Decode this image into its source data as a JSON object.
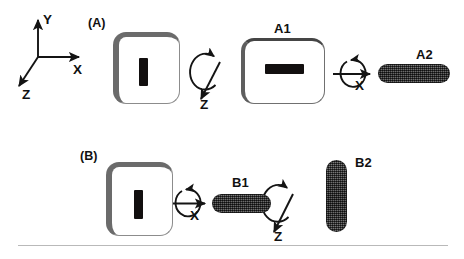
{
  "figure": {
    "background_color": "#ffffff",
    "ink_color": "#141414",
    "rod_color": "#4b4b4b",
    "marker_color": "#120f0f",
    "rule_color": "#b9b9b9"
  },
  "axes_key": {
    "name": "coordinate-axes-key",
    "origin_label": "",
    "axis_y_label": "Y",
    "axis_x_label": "X",
    "axis_z_label": "Z",
    "description": "Right-handed axis triad: Y up, X right, Z toward lower-left"
  },
  "panels": [
    {
      "id": "A",
      "label": "(A)",
      "steps": [
        {
          "name": "start-object",
          "shape": "rounded-square-card",
          "marker": "vertical-bar",
          "label": ""
        },
        {
          "name": "rotation-step-1",
          "shape": "rotation-arrow",
          "axis_label": "Z",
          "axis_direction": "down-left",
          "spin": "counterclockwise-about-z"
        },
        {
          "name": "intermediate-object",
          "shape": "rounded-rect-card",
          "marker": "horizontal-bar",
          "label": "A1"
        },
        {
          "name": "rotation-step-2",
          "shape": "rotation-arrow",
          "axis_label": "X",
          "axis_direction": "right",
          "spin": "counterclockwise-about-x"
        },
        {
          "name": "final-object",
          "shape": "horizontal-rod",
          "marker": "",
          "label": "A2"
        }
      ]
    },
    {
      "id": "B",
      "label": "(B)",
      "steps": [
        {
          "name": "start-object",
          "shape": "rounded-square-card",
          "marker": "vertical-bar",
          "label": ""
        },
        {
          "name": "rotation-step-1",
          "shape": "rotation-arrow",
          "axis_label": "X",
          "axis_direction": "right",
          "spin": "counterclockwise-about-x"
        },
        {
          "name": "intermediate-object",
          "shape": "horizontal-rod",
          "marker": "",
          "label": "B1"
        },
        {
          "name": "rotation-step-2",
          "shape": "rotation-arrow",
          "axis_label": "Z",
          "axis_direction": "down-left",
          "spin": "counterclockwise-about-z"
        },
        {
          "name": "final-object",
          "shape": "vertical-rod",
          "marker": "",
          "label": "B2"
        }
      ]
    }
  ],
  "labels": {
    "panel_a": "(A)",
    "panel_b": "(B)",
    "a1": "A1",
    "a2": "A2",
    "b1": "B1",
    "b2": "B2",
    "axis_x": "X",
    "axis_y": "Y",
    "axis_z": "Z",
    "rot_a_z": "Z",
    "rot_a_x": "X",
    "rot_b_x": "X",
    "rot_b_z": "Z"
  }
}
